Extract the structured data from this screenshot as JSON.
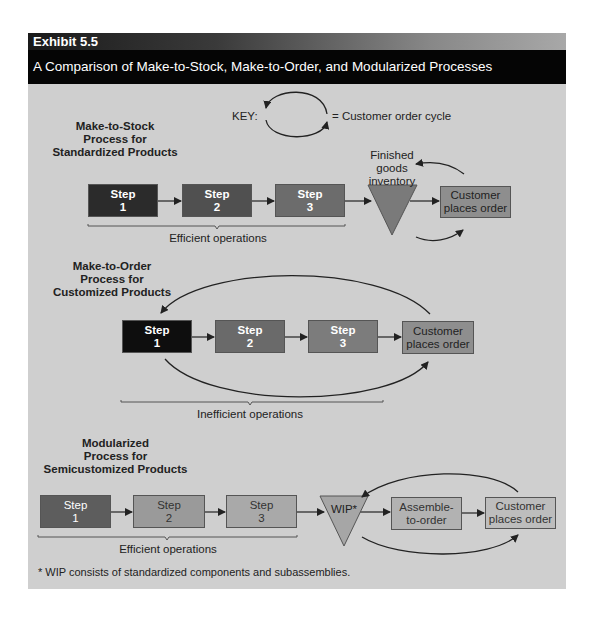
{
  "header": {
    "exhibit": "Exhibit 5.5",
    "title": "A Comparison of Make-to-Stock, Make-to-Order, and Modularized Processes"
  },
  "key": {
    "label": "KEY:",
    "description": "= Customer order cycle"
  },
  "make_to_stock": {
    "title_lines": [
      "Make-to-Stock",
      "Process for",
      "Standardized Products"
    ],
    "steps": [
      {
        "label": "Step",
        "num": "1",
        "color": "#2b2b2b"
      },
      {
        "label": "Step",
        "num": "2",
        "color": "#505050"
      },
      {
        "label": "Step",
        "num": "3",
        "color": "#6c6c6c"
      }
    ],
    "inventory_lines": [
      "Finished",
      "goods",
      "inventory"
    ],
    "customer_lines": [
      "Customer",
      "places order"
    ],
    "bracket_label": "Efficient operations"
  },
  "make_to_order": {
    "title_lines": [
      "Make-to-Order",
      "Process for",
      "Customized Products"
    ],
    "steps": [
      {
        "label": "Step",
        "num": "1",
        "color": "#0e0e0e"
      },
      {
        "label": "Step",
        "num": "2",
        "color": "#6a6a6a"
      },
      {
        "label": "Step",
        "num": "3",
        "color": "#7c7c7c"
      }
    ],
    "customer_lines": [
      "Customer",
      "places order"
    ],
    "bracket_label": "Inefficient operations"
  },
  "modularized": {
    "title_lines": [
      "Modularized",
      "Process for",
      "Semicustomized Products"
    ],
    "steps": [
      {
        "label": "Step",
        "num": "1",
        "color": "#5d5d5d"
      },
      {
        "label": "Step",
        "num": "2",
        "color": "#9a9a9a"
      },
      {
        "label": "Step",
        "num": "3",
        "color": "#a9a9a9"
      }
    ],
    "wip_label": "WIP*",
    "assemble_lines": [
      "Assemble-",
      "to-order"
    ],
    "customer_lines": [
      "Customer",
      "places order"
    ],
    "bracket_label": "Efficient operations"
  },
  "footnote": "* WIP consists of standardized components and subassemblies.",
  "colors": {
    "panel_bg": "#cfcfcf",
    "header_bg": "#050505",
    "triangle": "#7a7a7a",
    "wip_triangle": "#a6a6a6",
    "customer_box": "#8e8e8e",
    "customer_box_light": "#bdbdbd",
    "assemble_box": "#b2b2b2"
  }
}
